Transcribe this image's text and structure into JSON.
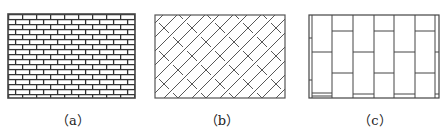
{
  "figure": {
    "panels": [
      {
        "id": "a",
        "caption": "（a）",
        "pattern": "running-bond-brick"
      },
      {
        "id": "b",
        "caption": "（b）",
        "pattern": "diagonal-herringbone"
      },
      {
        "id": "c",
        "caption": "（c）",
        "pattern": "vertical-stack-bond"
      }
    ]
  }
}
